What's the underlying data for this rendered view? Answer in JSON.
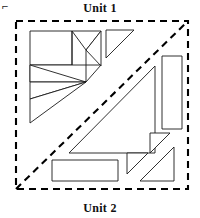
{
  "figure": {
    "corner_mark": "⌐",
    "labels": {
      "unit_1": "Unit 1",
      "unit_2": "Unit 2"
    },
    "colors": {
      "piece_stroke": "#1a1a1a",
      "piece_fill": "#ffffff",
      "dashed_stroke": "#000000",
      "background": "#ffffff",
      "label_text": "#111111"
    },
    "frame": {
      "name": "dashed-square-boundary",
      "x": 16,
      "y": 21,
      "width": 172,
      "height": 168,
      "dash_pattern": "7 5",
      "stroke_width": 2.1
    },
    "divider": {
      "name": "dashed-diagonal-divider",
      "x1": 16,
      "y1": 189,
      "x2": 188,
      "y2": 21,
      "dash_pattern": "7 5"
    },
    "unit_1_pieces": [
      {
        "name": "tangram-cluster-square-upper-left",
        "type": "square",
        "points": "30,31 72,31 72,65 30,65"
      },
      {
        "name": "tangram-cluster-triangle-top-right-left",
        "type": "triangle",
        "points": "72,31 101,31 86,50"
      },
      {
        "name": "tangram-cluster-triangle-top-right-right",
        "type": "triangle",
        "points": "101,31 101,65 86,50"
      },
      {
        "name": "tangram-cluster-parallelogram-middle",
        "type": "parallelogram",
        "points": "30,65 72,65 101,65 86,82"
      },
      {
        "name": "tangram-cluster-triangle-left-middle",
        "type": "triangle",
        "points": "30,65 59,94 30,94"
      },
      {
        "name": "tangram-cluster-triangle-center",
        "type": "triangle",
        "points": "30,65 86,82 59,94"
      },
      {
        "name": "tangram-cluster-triangle-lower-wedge",
        "type": "triangle",
        "points": "59,94 86,82 86,82"
      },
      {
        "name": "tangram-cluster-triangle-bottom-left",
        "type": "triangle",
        "points": "30,94 59,94 30,123"
      },
      {
        "name": "tangram-cluster-triangle-bottom-right",
        "type": "triangle",
        "points": "59,94 86,82 30,123"
      },
      {
        "name": "small-triangle-top-right",
        "type": "triangle",
        "points": "106,30 134,30 106,58"
      }
    ],
    "unit_2_pieces": [
      {
        "name": "large-triangle-center",
        "type": "triangle",
        "points": "69,153 155,66 155,153"
      },
      {
        "name": "tall-rectangle-right",
        "type": "rectangle",
        "points": "162,56 182,56 182,129 162,129"
      },
      {
        "name": "horizontal-rectangle-bottom",
        "type": "rectangle",
        "points": "52,160 118,160 118,181 52,181"
      },
      {
        "name": "small-triangle-bottom-center",
        "type": "triangle",
        "points": "127,153 148,153 127,174"
      },
      {
        "name": "small-triangle-upper-right-notch",
        "type": "triangle",
        "points": "150,133 170,133 150,153"
      },
      {
        "name": "triangle-bottom-right",
        "type": "triangle",
        "points": "140,181 174,147 174,181"
      }
    ]
  }
}
